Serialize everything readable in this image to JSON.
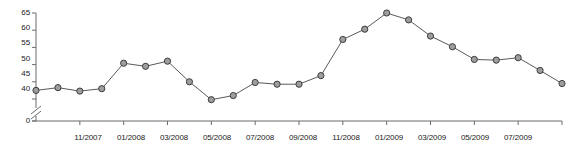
{
  "chart_data": {
    "type": "line",
    "title": "",
    "xlabel": "",
    "ylabel": "",
    "ylim": [
      40,
      65
    ],
    "yticks": [
      40,
      45,
      50,
      55,
      60,
      65
    ],
    "zero_tick": 0,
    "axis_break": true,
    "grid": false,
    "legend": null,
    "marker": "circle",
    "categories": [
      "09/2007",
      "10/2007",
      "11/2007",
      "12/2007",
      "01/2008",
      "02/2008",
      "03/2008",
      "04/2008",
      "05/2008",
      "06/2008",
      "07/2008",
      "08/2008",
      "09/2008",
      "10/2008",
      "11/2008",
      "12/2008",
      "01/2009",
      "02/2009",
      "03/2009",
      "04/2009",
      "05/2009",
      "06/2009",
      "07/2009",
      "08/2009",
      "09/2009"
    ],
    "x_tick_labels": [
      "11/2007",
      "01/2008",
      "03/2008",
      "05/2008",
      "07/2008",
      "09/2008",
      "11/2008",
      "01/2009",
      "03/2009",
      "05/2009",
      "07/2009"
    ],
    "x_tick_indices": [
      2,
      4,
      6,
      8,
      10,
      12,
      14,
      16,
      18,
      20,
      22
    ],
    "values": [
      42.5,
      43.3,
      42.3,
      43.0,
      50.4,
      49.5,
      51.0,
      45.0,
      39.8,
      41.0,
      44.8,
      44.3,
      44.3,
      46.8,
      57.3,
      60.3,
      65.0,
      63.0,
      58.3,
      55.2,
      51.5,
      51.3,
      52.0,
      48.3,
      44.5
    ],
    "colors": {
      "line": "#5a5a5a",
      "marker_fill": "#9e9e9e",
      "marker_stroke": "#3d3d3d",
      "axis": "#6b6b6b",
      "text": "#1a1a1a"
    }
  }
}
